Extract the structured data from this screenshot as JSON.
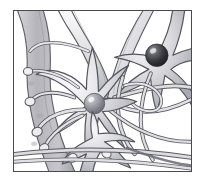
{
  "figure": {
    "caption": "Grayscale pen-and-ink style illustration of interconnected nerve cells",
    "style": "grayscale scientific line illustration",
    "background_color": "#ffffff",
    "frame": {
      "border_color": "#4a4a52",
      "border_width_px": 1.5,
      "x": 13,
      "y": 10,
      "width": 179,
      "height": 162
    },
    "palette": {
      "outline": "#55555d",
      "outline_dark": "#3c3c44",
      "cell_fill_light": "#f2f2f4",
      "cell_fill_mid": "#c9c9cf",
      "cell_fill_dark": "#9a9aa2",
      "vessel_fill": "#b8b8be",
      "nucleus_dark": "#2e2e34",
      "nucleus_light": "#8b8b93",
      "highlight": "#ffffff"
    },
    "elements": [
      {
        "name": "blood-vessel",
        "label": "Blood vessel / capillary",
        "position": "left edge, vertical",
        "fill": "#b8b8be"
      },
      {
        "name": "neuron-upper-right",
        "label": "Neuron cell body (upper right)",
        "nucleus_color": "#2e2e34",
        "nucleus_cx": 155,
        "nucleus_cy": 54,
        "nucleus_r": 11,
        "dendrite_count": 6
      },
      {
        "name": "neuron-center",
        "label": "Neuron cell body (center)",
        "nucleus_color": "#8b8b93",
        "nucleus_cx": 85,
        "nucleus_cy": 105,
        "nucleus_r": 10,
        "dendrite_count": 7
      },
      {
        "name": "neuron-lower",
        "label": "Neuron cell body (lower center)",
        "nucleus_color": "none",
        "dendrite_count": 4
      },
      {
        "name": "axon-bundle-bottom",
        "label": "Horizontal axon bundle along lower edge"
      },
      {
        "name": "dendrite-tangle-right",
        "label": "Crossing dendrite tangle (right of center)"
      }
    ]
  }
}
